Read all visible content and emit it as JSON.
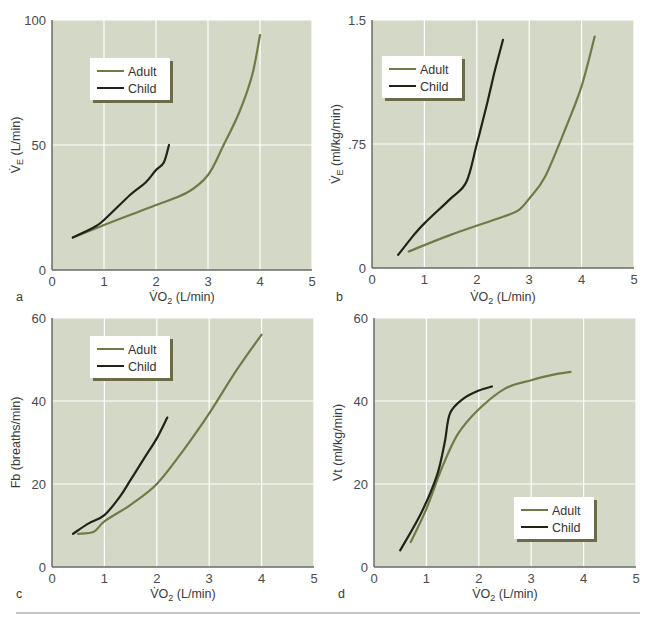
{
  "figure": {
    "bottom_rule_color": "#8a8a8a",
    "colors": {
      "plot_bg": "#d4d9c7",
      "grid": "#ffffff",
      "adult": "#6f7b47",
      "child": "#1e2418",
      "axis": "#6a6a6a",
      "legend_bg": "#ffffff",
      "legend_shadow": "#6b6b4a"
    }
  },
  "chart_data": [
    {
      "id": "a",
      "type": "line",
      "panel_label": "a",
      "title": "",
      "xlabel": "V̇O2 (L/min)",
      "xlabel_main": "V̇O",
      "xlabel_sub": "2",
      "xlabel_rest": " (L/min)",
      "ylabel": "V̇E (L/min)",
      "ylabel_main": "V̇",
      "ylabel_sub": "E",
      "ylabel_rest": " (L/min)",
      "xlim": [
        0,
        5
      ],
      "ylim": [
        0,
        100
      ],
      "xticks": [
        "0",
        "1",
        "2",
        "3",
        "4",
        "5"
      ],
      "yticks": [
        "0",
        "50",
        "100"
      ],
      "ytick_values": [
        0,
        50,
        100
      ],
      "grid": true,
      "legend": {
        "position": "upper-left",
        "entries": [
          "Adult",
          "Child"
        ]
      },
      "series": [
        {
          "name": "Adult",
          "x": [
            0.4,
            1.0,
            1.5,
            2.0,
            2.6,
            3.0,
            3.3,
            3.6,
            3.85,
            4.0
          ],
          "y": [
            13,
            18,
            22,
            26,
            31,
            38,
            50,
            63,
            78,
            94
          ]
        },
        {
          "name": "Child",
          "x": [
            0.4,
            0.8,
            1.0,
            1.5,
            1.8,
            2.0,
            2.15,
            2.25
          ],
          "y": [
            13,
            17,
            20,
            30,
            35,
            40,
            43,
            50
          ]
        }
      ]
    },
    {
      "id": "b",
      "type": "line",
      "panel_label": "b",
      "title": "",
      "xlabel": "V̇O2 (L/min)",
      "xlabel_main": "V̇O",
      "xlabel_sub": "2",
      "xlabel_rest": " (L/min)",
      "ylabel": "V̇E (ml/kg/min)",
      "ylabel_main": "V̇",
      "ylabel_sub": "E",
      "ylabel_rest": " (ml/kg/min)",
      "xlim": [
        0,
        5
      ],
      "ylim": [
        0,
        1.5
      ],
      "xticks": [
        "0",
        "1",
        "2",
        "3",
        "4",
        "5"
      ],
      "yticks": [
        "0",
        ".75",
        "1.5"
      ],
      "ytick_values": [
        0,
        0.75,
        1.5
      ],
      "grid": true,
      "legend": {
        "position": "upper-left",
        "entries": [
          "Adult",
          "Child"
        ]
      },
      "series": [
        {
          "name": "Adult",
          "x": [
            0.7,
            1.5,
            2.5,
            2.8,
            3.0,
            3.3,
            3.7,
            4.0,
            4.25
          ],
          "y": [
            0.1,
            0.2,
            0.31,
            0.35,
            0.42,
            0.55,
            0.85,
            1.1,
            1.4
          ]
        },
        {
          "name": "Child",
          "x": [
            0.5,
            0.8,
            1.0,
            1.5,
            1.8,
            2.0,
            2.2,
            2.35,
            2.5
          ],
          "y": [
            0.08,
            0.2,
            0.27,
            0.42,
            0.52,
            0.75,
            1.0,
            1.2,
            1.38
          ]
        }
      ]
    },
    {
      "id": "c",
      "type": "line",
      "panel_label": "c",
      "title": "",
      "xlabel": "V̇O2 (L/min)",
      "xlabel_main": "V̇O",
      "xlabel_sub": "2",
      "xlabel_rest": " (L/min)",
      "ylabel": "Fb (breaths/min)",
      "ylabel_main": "Fb",
      "ylabel_sub": "",
      "ylabel_rest": " (breaths/min)",
      "xlim": [
        0,
        5
      ],
      "ylim": [
        0,
        60
      ],
      "xticks": [
        "0",
        "1",
        "2",
        "3",
        "4",
        "5"
      ],
      "yticks": [
        "0",
        "20",
        "40",
        "60"
      ],
      "ytick_values": [
        0,
        20,
        40,
        60
      ],
      "grid": true,
      "legend": {
        "position": "upper-left",
        "entries": [
          "Adult",
          "Child"
        ]
      },
      "series": [
        {
          "name": "Adult",
          "x": [
            0.5,
            0.8,
            1.0,
            1.5,
            2.0,
            2.5,
            3.0,
            3.5,
            4.0
          ],
          "y": [
            8,
            8.5,
            11,
            15,
            20,
            28,
            37,
            47,
            56
          ]
        },
        {
          "name": "Child",
          "x": [
            0.4,
            0.7,
            1.0,
            1.3,
            1.5,
            1.8,
            2.0,
            2.2
          ],
          "y": [
            8,
            10.5,
            12.5,
            17,
            21,
            27,
            31,
            36
          ]
        }
      ]
    },
    {
      "id": "d",
      "type": "line",
      "panel_label": "d",
      "title": "",
      "xlabel": "V̇O2 (L/min)",
      "xlabel_main": "V̇O",
      "xlabel_sub": "2",
      "xlabel_rest": " (L/min)",
      "ylabel": "Vt (ml/kg/min)",
      "ylabel_main": "Vt",
      "ylabel_sub": "",
      "ylabel_rest": " (ml/kg/min)",
      "xlim": [
        0,
        5
      ],
      "ylim": [
        0,
        60
      ],
      "xticks": [
        "0",
        "1",
        "2",
        "3",
        "4",
        "5"
      ],
      "yticks": [
        "0",
        "20",
        "40",
        "60"
      ],
      "ytick_values": [
        0,
        20,
        40,
        60
      ],
      "grid": true,
      "legend": {
        "position": "lower-right",
        "entries": [
          "Adult",
          "Child"
        ]
      },
      "series": [
        {
          "name": "Adult",
          "x": [
            0.7,
            1.0,
            1.3,
            1.6,
            2.0,
            2.5,
            3.0,
            3.4,
            3.75
          ],
          "y": [
            6,
            14,
            24,
            32,
            38,
            43,
            45,
            46.3,
            47
          ]
        },
        {
          "name": "Child",
          "x": [
            0.5,
            0.9,
            1.2,
            1.35,
            1.45,
            1.7,
            2.0,
            2.25
          ],
          "y": [
            4,
            13,
            22,
            30,
            37,
            40.5,
            42.5,
            43.5
          ]
        }
      ]
    }
  ],
  "layout_boxes": {
    "a": {
      "x0": 52,
      "x1": 312,
      "y0": 270,
      "y1": 20,
      "legend": [
        90,
        58,
        80,
        42
      ],
      "letter": [
        16,
        301
      ],
      "xlabel_y": 301,
      "ylabel_x": 20
    },
    "b": {
      "x0": 372,
      "x1": 634,
      "y0": 268,
      "y1": 20,
      "legend": [
        382,
        56,
        80,
        42
      ],
      "letter": [
        336,
        301
      ],
      "xlabel_y": 301,
      "ylabel_x": 340
    },
    "c": {
      "x0": 52,
      "x1": 314,
      "y0": 567,
      "y1": 318,
      "legend": [
        90,
        336,
        80,
        42
      ],
      "letter": [
        16,
        598
      ],
      "xlabel_y": 598,
      "ylabel_x": 20
    },
    "d": {
      "x0": 374,
      "x1": 636,
      "y0": 567,
      "y1": 318,
      "legend": [
        514,
        497,
        80,
        42
      ],
      "letter": [
        338,
        598
      ],
      "xlabel_y": 598,
      "ylabel_x": 342
    }
  }
}
